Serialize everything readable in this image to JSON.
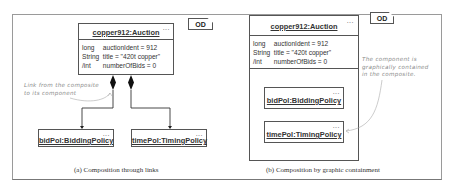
{
  "figure": {
    "panels": [
      {
        "id": "a",
        "caption": "(a) Composition through  links",
        "diagram_tag": "OD",
        "composite": {
          "title": "copper912:Auction",
          "more": "...",
          "attributes": [
            {
              "type": "long",
              "value": "auctionIdent = 912"
            },
            {
              "type": "String",
              "value": "title = \"420t copper\""
            },
            {
              "type": "/int",
              "value": "numberOfBids = 0"
            }
          ]
        },
        "components": [
          {
            "title": "bidPol:BiddingPolicy",
            "more": "..."
          },
          {
            "title": "timePol:TimingPolicy",
            "more": "..."
          }
        ],
        "note": [
          "Link from the composite",
          "to its component"
        ]
      },
      {
        "id": "b",
        "caption": "(b) Composition by graphic containment",
        "diagram_tag": "OD",
        "composite": {
          "title": "copper912:Auction",
          "more": "...",
          "attributes": [
            {
              "type": "long",
              "value": "auctionIdent = 912"
            },
            {
              "type": "String",
              "value": "title = \"420t copper\""
            },
            {
              "type": "/int",
              "value": "numberOfBids = 0"
            }
          ]
        },
        "components": [
          {
            "title": "bidPol:BiddingPolicy",
            "more": "..."
          },
          {
            "title": "timePol:TimingPolicy",
            "more": "..."
          }
        ],
        "note": [
          "The component is",
          "graphically contained",
          "in the composite."
        ]
      }
    ]
  }
}
